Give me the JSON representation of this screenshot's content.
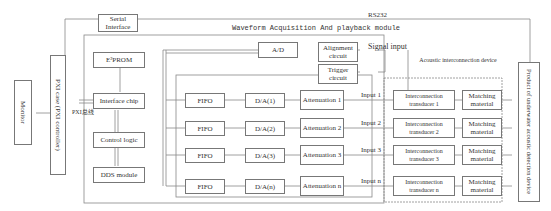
{
  "title": "Waveform Acquisition And playback module",
  "labels": {
    "serial_interface": "Serial Interface",
    "rs232": "RS232",
    "pxi_case": "PXI case (PXI controller)",
    "monitor": "Monitor",
    "pxi_bus": "PXI总线",
    "e2prom": "E²PROM",
    "interface_chip": "Interface chip",
    "control_logic": "Control logic",
    "dds_module": "DDS module",
    "ad": "A/D",
    "alignment": "Alignment circuit",
    "trigger": "Trigger circuit",
    "signal_input": "Signal input",
    "acoustic_device": "Acoustic interconnection device",
    "product": "Product of underwater acoustic detection device"
  },
  "channels": [
    {
      "fifo": "FIFO",
      "da": "D/A(1)",
      "att": "Attenuation 1",
      "input": "Input 1",
      "trans": "Interconnection transducer 1",
      "match": "Matching material"
    },
    {
      "fifo": "FIFO",
      "da": "D/A(2)",
      "att": "Attenuation 2",
      "input": "Input 2",
      "trans": "Interconnection transducer 2",
      "match": "Matching material"
    },
    {
      "fifo": "FIFO",
      "da": "D/A(3)",
      "att": "Attenuation 3",
      "input": "Input 3",
      "trans": "Interconnection transducer 3",
      "match": "Matching material"
    },
    {
      "fifo": "FIFO",
      "da": "D/A(n)",
      "att": "Attenuation n",
      "input": "Input n",
      "trans": "Interconnection transducer n",
      "match": "Matching material"
    }
  ]
}
